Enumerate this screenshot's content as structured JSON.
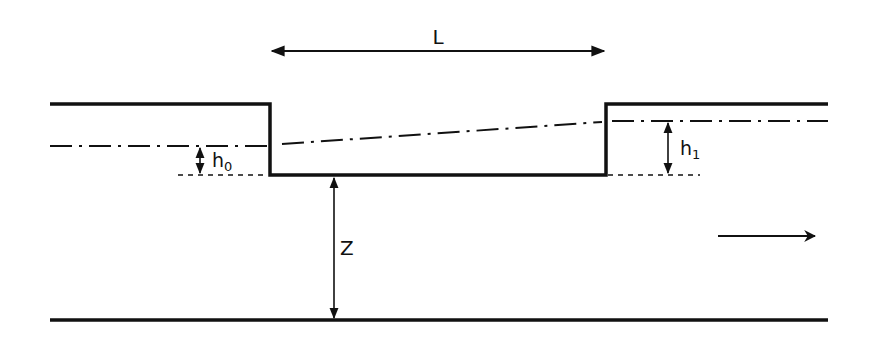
{
  "diagram": {
    "type": "hydraulic-channel-step",
    "labels": {
      "length": "L",
      "upstream_depth": "h",
      "upstream_depth_sub": "0",
      "downstream_depth": "h",
      "downstream_depth_sub": "1",
      "height": "Z"
    },
    "elements": {
      "length_dimension": "L",
      "flow_direction": "left-to-right",
      "water_surface_style": "dash-dot",
      "reference_line_style": "dashed"
    },
    "colors": {
      "ink": "#111111",
      "background": "#ffffff"
    }
  }
}
